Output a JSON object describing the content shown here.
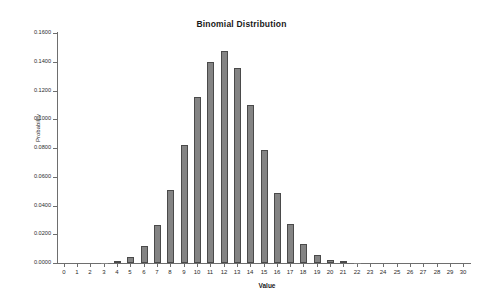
{
  "chart_data": {
    "type": "bar",
    "title": "Binomial Distribution",
    "xlabel": "Value",
    "ylabel": "Probability",
    "categories": [
      "0",
      "1",
      "2",
      "3",
      "4",
      "5",
      "6",
      "7",
      "8",
      "9",
      "10",
      "11",
      "12",
      "13",
      "14",
      "15",
      "16",
      "17",
      "18",
      "19",
      "20",
      "21",
      "22",
      "23",
      "24",
      "25",
      "26",
      "27",
      "28",
      "29",
      "30"
    ],
    "values": [
      0.0,
      0.0,
      0.0,
      0.0003,
      0.0012,
      0.0041,
      0.0115,
      0.0263,
      0.0505,
      0.0823,
      0.1152,
      0.1396,
      0.1474,
      0.136,
      0.1101,
      0.0783,
      0.0489,
      0.0269,
      0.0129,
      0.0054,
      0.002,
      0.0006,
      0.0002,
      0.0,
      0.0,
      0.0,
      0.0,
      0.0,
      0.0,
      0.0,
      0.0
    ],
    "ylim": [
      0.0,
      0.16
    ],
    "ytick_labels": [
      "0.0000",
      "0.0200",
      "0.0400",
      "0.0600",
      "0.0800",
      "0.1000",
      "0.1200",
      "0.1400",
      "0.1600"
    ],
    "ytick_values": [
      0.0,
      0.02,
      0.04,
      0.06,
      0.08,
      0.1,
      0.12,
      0.14,
      0.16
    ],
    "xlim": [
      0,
      30
    ],
    "grid": false,
    "legend": false,
    "bar_color": "#848484",
    "bar_border_color": "#4a4a4a",
    "axis_color": "#6e6e6e",
    "background_color": "#ffffff"
  }
}
